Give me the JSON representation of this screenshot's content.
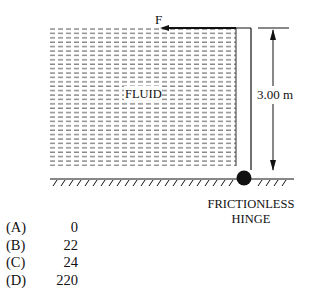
{
  "diagram": {
    "force_label": "F",
    "fluid_label": "FLUID",
    "dimension_label": "3.00 m",
    "hinge_label_line1": "FRICTIONLESS",
    "hinge_label_line2": "HINGE",
    "colors": {
      "ink": "#111111",
      "fluid_dash": "#555555",
      "background": "#ffffff"
    }
  },
  "choices": [
    {
      "letter": "(A)",
      "value": "0"
    },
    {
      "letter": "(B)",
      "value": "22"
    },
    {
      "letter": "(C)",
      "value": "24"
    },
    {
      "letter": "(D)",
      "value": "220"
    }
  ]
}
